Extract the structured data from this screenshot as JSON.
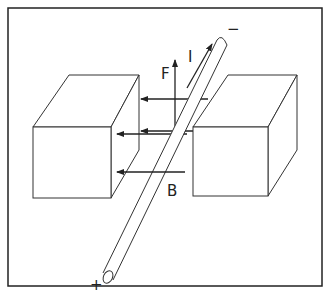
{
  "diagram": {
    "labels": {
      "force": "F",
      "current": "I",
      "field": "B",
      "positive_terminal": "+",
      "negative_terminal": "−"
    },
    "components": [
      {
        "id": "left-magnet-block",
        "type": "box"
      },
      {
        "id": "right-magnet-block",
        "type": "box"
      },
      {
        "id": "conductor-rod",
        "type": "cylinder"
      },
      {
        "id": "field-arrows",
        "type": "arrows",
        "count": 3,
        "direction": "left"
      },
      {
        "id": "force-arrow",
        "type": "arrow",
        "direction": "up"
      },
      {
        "id": "current-arrow",
        "type": "arrow",
        "direction": "up-right"
      }
    ],
    "colors": {
      "line": "#222222",
      "background": "#ffffff"
    }
  }
}
